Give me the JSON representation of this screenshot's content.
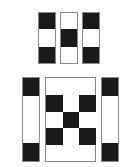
{
  "colors": {
    "dark": "#1a1a1a",
    "light": "#ffffff",
    "border": "#888888"
  },
  "top_piece": {
    "columns": [
      {
        "cells": [
          "black",
          "white",
          "black"
        ]
      },
      {
        "cells": [
          "white",
          "black",
          "white"
        ]
      },
      {
        "cells": [
          "black",
          "white",
          "black"
        ]
      }
    ]
  },
  "bottom_piece": {
    "left_bar": [
      "black",
      "white",
      "black"
    ],
    "center_grid": [
      [
        "black",
        "white",
        "black"
      ],
      [
        "white",
        "black",
        "white"
      ],
      [
        "black",
        "white",
        "black"
      ]
    ],
    "right_bar": [
      "black",
      "white",
      "black"
    ]
  }
}
